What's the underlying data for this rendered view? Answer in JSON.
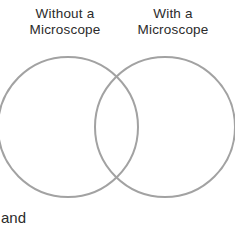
{
  "figure": {
    "type": "venn-diagram",
    "background_color": "#ffffff",
    "width": 235,
    "height": 225
  },
  "labels": {
    "left": "Without a\nMicroscope",
    "right": "With a\nMicroscope"
  },
  "caption": {
    "clipped_text": "and"
  },
  "circles": {
    "stroke_color": "#a2a2a2",
    "fill": "none",
    "stroke_width": 2,
    "left": {
      "cx": 68,
      "cy": 127,
      "r": 70
    },
    "right": {
      "cx": 165,
      "cy": 127,
      "r": 70
    }
  }
}
